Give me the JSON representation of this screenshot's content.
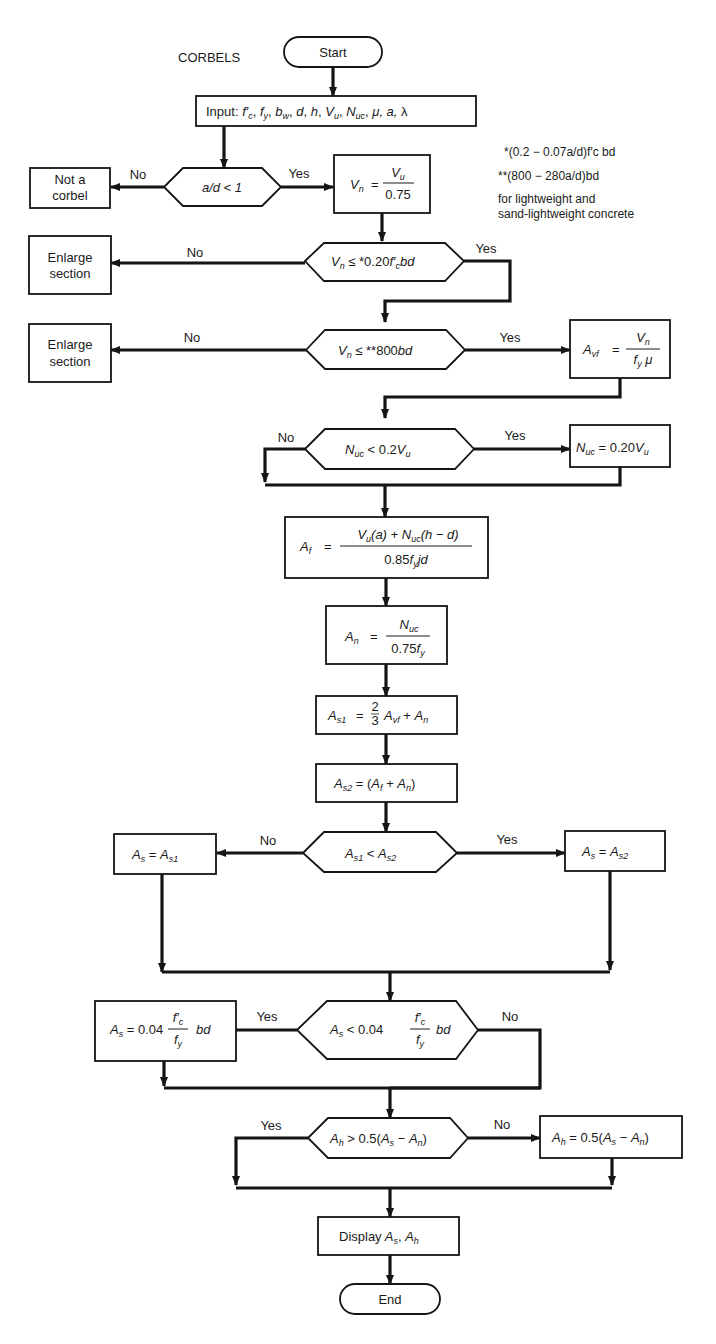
{
  "title": "CORBELS",
  "terminals": {
    "start": "Start",
    "end": "End"
  },
  "input_box": "Input: f′c, fy, bw, d, h, Vu, Nuc, μ, a, λ",
  "notes": {
    "note1": "*(0.2 − 0.07a/d)f′c bd",
    "note2": "**(800 − 280a/d)bd",
    "note3_line1": "for lightweight and",
    "note3_line2": "sand-lightweight concrete"
  },
  "decisions": [
    {
      "id": "d1",
      "text": "a/d < 1",
      "yes": "Yes",
      "no": "No"
    },
    {
      "id": "d2",
      "text": "Vn ≤ *0.20f′c bd",
      "yes": "Yes",
      "no": "No"
    },
    {
      "id": "d3",
      "text": "Vn ≤ **800bd",
      "yes": "Yes",
      "no": "No"
    },
    {
      "id": "d4",
      "text": "Nuc < 0.2Vu",
      "yes": "Yes",
      "no": "No"
    },
    {
      "id": "d5",
      "text": "As1 < As2",
      "yes": "Yes",
      "no": "No"
    },
    {
      "id": "d6",
      "text": "As < 0.04 (f′c / fy) bd",
      "yes": "Yes",
      "no": "No"
    },
    {
      "id": "d7",
      "text": "Ah > 0.5(As − An)",
      "yes": "Yes",
      "no": "No"
    }
  ],
  "process": {
    "not_corbel_1": "Not a",
    "not_corbel_2": "corbel",
    "enlarge_1": "Enlarge",
    "enlarge_2": "section",
    "vn": "Vn = Vu / 0.75",
    "avf": "Avf = Vn / (fy μ)",
    "nuc": "Nuc = 0.20Vu",
    "af": "Af = [Vu(a) + Nuc(h − d)] / 0.85fy jd",
    "an": "An = Nuc / 0.75fy",
    "as1": "As1 = 2/3 Avf + An",
    "as2": "As2 = (Af + An)",
    "as_as1": "As = As1",
    "as_as2": "As = As2",
    "as_min": "As = 0.04 (f′c / fy) bd",
    "ah": "Ah = 0.5(As − An)",
    "display_prefix": "Display",
    "display": "Display As, Ah"
  },
  "labels": {
    "yes": "Yes",
    "no": "No",
    "equals": "=",
    "zero75": "0.75",
    "two_thirds_num": "2",
    "two_thirds_den": "3"
  }
}
